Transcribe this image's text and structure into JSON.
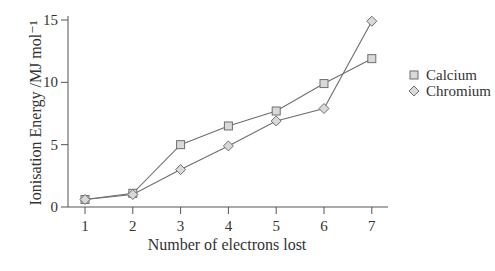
{
  "chart_data": {
    "type": "line",
    "title": "",
    "xlabel": "Number of electrons lost",
    "ylabel": "Ionisation Energy /MJ mol⁻¹",
    "x": [
      1,
      2,
      3,
      4,
      5,
      6,
      7
    ],
    "xticks": [
      "1",
      "2",
      "3",
      "4",
      "5",
      "6",
      "7"
    ],
    "yticks": [
      "0",
      "5",
      "10",
      "15"
    ],
    "ylim": [
      0,
      15
    ],
    "xlim": [
      0.6,
      7.3
    ],
    "grid": false,
    "legend_position": "right",
    "series": [
      {
        "name": "Calcium",
        "marker": "square",
        "values": [
          0.6,
          1.1,
          5.0,
          6.5,
          7.7,
          9.9,
          11.9
        ]
      },
      {
        "name": "Chromium",
        "marker": "diamond",
        "values": [
          0.6,
          1.0,
          3.0,
          4.9,
          6.9,
          7.9,
          14.9
        ]
      }
    ]
  },
  "colors": {
    "line": "#6e6e6e",
    "axis": "#555555",
    "marker_fill": "#d9d9d9",
    "text": "#333333"
  }
}
